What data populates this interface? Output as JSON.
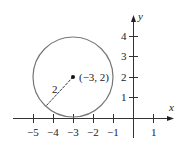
{
  "diagram": {
    "type": "coordinate-plane-circle",
    "x_axis": {
      "label": "x",
      "ticks": [
        "−5",
        "−4",
        "−3",
        "−2",
        "−1",
        "1"
      ],
      "tick_values": [
        -5,
        -4,
        -3,
        -2,
        -1,
        1
      ]
    },
    "y_axis": {
      "label": "y",
      "ticks": [
        "1",
        "2",
        "3",
        "4"
      ],
      "tick_values": [
        1,
        2,
        3,
        4
      ]
    },
    "circle": {
      "center": [
        -3,
        2
      ],
      "radius": 2,
      "color": "#777777"
    },
    "center_label": "(−3, 2)",
    "radius_label": "2"
  }
}
